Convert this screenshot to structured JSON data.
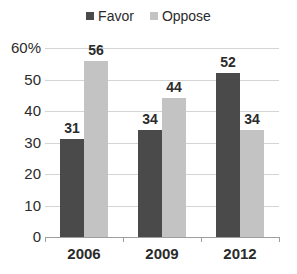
{
  "chart_data": {
    "type": "bar",
    "title": "",
    "xlabel": "",
    "ylabel": "",
    "categories": [
      "2006",
      "2009",
      "2012"
    ],
    "series": [
      {
        "name": "Favor",
        "values": [
          31,
          34,
          52
        ],
        "color": "#4a4a4a"
      },
      {
        "name": "Oppose",
        "values": [
          56,
          44,
          34
        ],
        "color": "#c3c3c3"
      }
    ],
    "ylim": [
      0,
      60
    ],
    "ytick_values": [
      0,
      10,
      20,
      30,
      40,
      50,
      60
    ],
    "ytick_labels": [
      "0",
      "10",
      "20",
      "30",
      "40",
      "50",
      "60%"
    ],
    "grid": true,
    "legend_position": "top-center",
    "data_labels": true
  },
  "legend": {
    "entries": [
      {
        "label": "Favor",
        "swatch": "legend-swatch-favor"
      },
      {
        "label": "Oppose",
        "swatch": "legend-swatch-oppose"
      }
    ]
  },
  "colors": {
    "favor": "#4a4a4a",
    "oppose": "#c3c3c3",
    "gridline": "#d4d4d4",
    "axis": "#9e9e9e",
    "text": "#2b2b2b",
    "background": "#ffffff"
  }
}
